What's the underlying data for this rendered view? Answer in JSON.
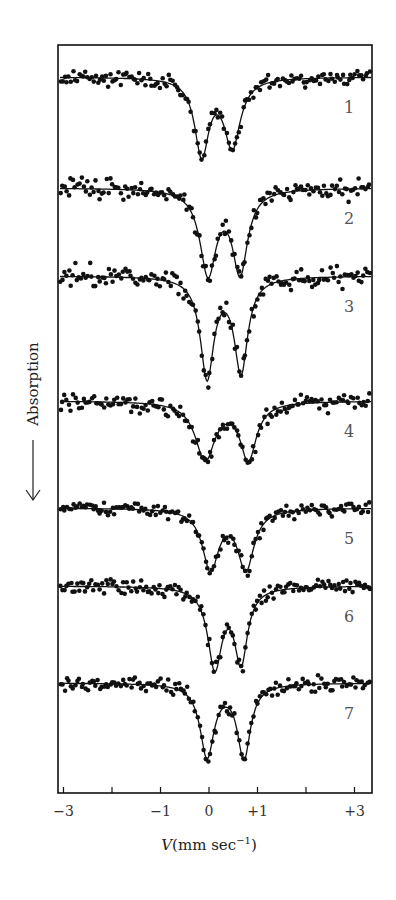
{
  "chart_data": {
    "type": "scatter",
    "title": "",
    "xlabel": "V(mm sec⁻¹)",
    "xlabel_parts": {
      "var": "V",
      "unit": "(mm sec",
      "sup": "−1",
      "close": ")"
    },
    "ylabel": "Absorption",
    "ylabel_arrow": "←",
    "xlim": [
      -3.2,
      3.3
    ],
    "xticks": [
      -3,
      -2,
      -1,
      0,
      1,
      2,
      3
    ],
    "xtick_labels": [
      {
        "value": -3,
        "label": "−3"
      },
      {
        "value": -1,
        "label": "−1"
      },
      {
        "value": 0,
        "label": "0"
      },
      {
        "value": 1,
        "label": "+1"
      },
      {
        "value": 3,
        "label": "+3"
      }
    ],
    "grid": false,
    "legend": "none; spectra labeled 1–7 at right",
    "series": [
      {
        "name": "1",
        "label": "1",
        "baseline_px": 77,
        "peaks": [
          {
            "v": -0.15,
            "depth_px": 76,
            "width": 0.26
          },
          {
            "v": 0.48,
            "depth_px": 68,
            "width": 0.3
          }
        ],
        "noise_px": 7
      },
      {
        "name": "2",
        "label": "2",
        "baseline_px": 188,
        "peaks": [
          {
            "v": -0.02,
            "depth_px": 84,
            "width": 0.3
          },
          {
            "v": 0.64,
            "depth_px": 82,
            "width": 0.28
          }
        ],
        "noise_px": 9
      },
      {
        "name": "3",
        "label": "3",
        "baseline_px": 276,
        "peaks": [
          {
            "v": -0.04,
            "depth_px": 100,
            "width": 0.25
          },
          {
            "v": 0.66,
            "depth_px": 94,
            "width": 0.25
          }
        ],
        "noise_px": 10
      },
      {
        "name": "4",
        "label": "4",
        "baseline_px": 401,
        "peaks": [
          {
            "v": -0.08,
            "depth_px": 58,
            "width": 0.36
          },
          {
            "v": 0.81,
            "depth_px": 57,
            "width": 0.3
          }
        ],
        "noise_px": 8
      },
      {
        "name": "5",
        "label": "5",
        "baseline_px": 508,
        "peaks": [
          {
            "v": 0.03,
            "depth_px": 60,
            "width": 0.3
          },
          {
            "v": 0.76,
            "depth_px": 60,
            "width": 0.3
          }
        ],
        "noise_px": 6
      },
      {
        "name": "6",
        "label": "6",
        "baseline_px": 586,
        "peaks": [
          {
            "v": 0.12,
            "depth_px": 80,
            "width": 0.26
          },
          {
            "v": 0.66,
            "depth_px": 74,
            "width": 0.24
          }
        ],
        "noise_px": 7
      },
      {
        "name": "7",
        "label": "7",
        "baseline_px": 683,
        "peaks": [
          {
            "v": -0.04,
            "depth_px": 73,
            "width": 0.26
          },
          {
            "v": 0.72,
            "depth_px": 74,
            "width": 0.24
          }
        ],
        "noise_px": 8
      }
    ]
  }
}
